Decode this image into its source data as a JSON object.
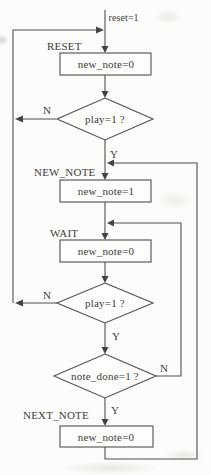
{
  "flowchart": {
    "entry": {
      "condition_label": "reset=1"
    },
    "states": {
      "reset": {
        "label": "RESET",
        "action": "new_note=0"
      },
      "new_note": {
        "label": "NEW_NOTE",
        "action": "new_note=1"
      },
      "wait": {
        "label": "WAIT",
        "action": "new_note=0"
      },
      "next_note": {
        "label": "NEXT_NOTE",
        "action": "new_note=0"
      }
    },
    "decisions": {
      "play_check_1": {
        "condition": "play=1 ?",
        "yes_label": "Y",
        "no_label": "N"
      },
      "play_check_2": {
        "condition": "play=1 ?",
        "yes_label": "Y",
        "no_label": "N"
      },
      "note_done_check": {
        "condition": "note_done=1 ?",
        "yes_label": "Y",
        "no_label": "N"
      }
    },
    "colors": {
      "line": "#4f4f4f",
      "text": "#3c3c3c",
      "background": "#fcfcfa"
    }
  }
}
